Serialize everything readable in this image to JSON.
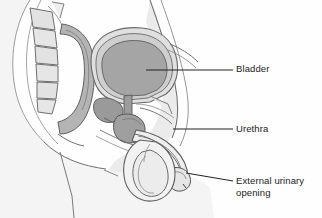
{
  "figure": {
    "background_color": "#fefefe",
    "width": 322,
    "height": 218
  },
  "palette": {
    "line": "#5a5a5a",
    "line_dark": "#3f3f3f",
    "text": "#1b1b1b",
    "leader": "#222222",
    "body_fill": "#f2f2f2",
    "tissue_light": "#e8e8e8",
    "tissue_mid": "#d2d2d2",
    "tissue_gray": "#b9b9b9",
    "organ_fill": "#a9a9a9",
    "organ_dark": "#8f8f8f"
  },
  "labels": [
    {
      "id": "bladder",
      "text": "Bladder",
      "lines": [
        "Bladder"
      ],
      "leader": {
        "x1": 146,
        "y1": 70,
        "x2": 233,
        "y2": 70
      }
    },
    {
      "id": "urethra",
      "text": "Urethra",
      "lines": [
        "Urethra"
      ],
      "leader": {
        "x1": 173,
        "y1": 129,
        "x2": 233,
        "y2": 129
      }
    },
    {
      "id": "external_urinary_opening",
      "text": "External urinary opening",
      "lines": [
        "External urinary",
        "opening"
      ],
      "leader": {
        "x1": 186,
        "y1": 173,
        "x2": 233,
        "y2": 181
      }
    }
  ],
  "structures": [
    {
      "id": "vertebrae",
      "name": "vertebral column",
      "fill": "#e4e4e4"
    },
    {
      "id": "rectum",
      "name": "rectum",
      "fill": "#b9b9b9"
    },
    {
      "id": "bladder",
      "name": "urinary bladder",
      "fill": "#a9a9a9"
    },
    {
      "id": "prostate",
      "name": "prostate gland",
      "fill": "#9a9a9a"
    },
    {
      "id": "penis",
      "name": "penis",
      "fill": "#ececec"
    },
    {
      "id": "testis",
      "name": "testis and scrotum",
      "fill": "#f0f0f0"
    },
    {
      "id": "urethra_tube",
      "name": "urethra",
      "fill": "#e0e0e0"
    },
    {
      "id": "body_wall",
      "name": "abdominal body wall",
      "fill": "#f2f2f2"
    }
  ]
}
